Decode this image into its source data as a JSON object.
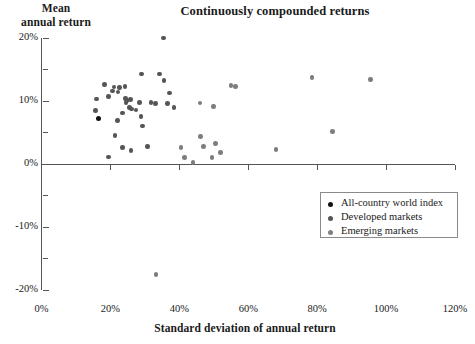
{
  "chart_data": {
    "type": "scatter",
    "title": "Continuously compounded returns",
    "xlabel": "Standard deviation of annual return",
    "ylabel": "Mean annual return",
    "xlim": [
      0,
      120
    ],
    "ylim": [
      -20,
      20
    ],
    "xticks": [
      "0%",
      "20%",
      "40%",
      "60%",
      "80%",
      "100%",
      "120%"
    ],
    "xtick_values": [
      0,
      20,
      40,
      60,
      80,
      100,
      120
    ],
    "yticks": [
      "20%",
      "10%",
      "0%",
      "-10%",
      "-20%"
    ],
    "ytick_values": [
      20,
      10,
      0,
      -10,
      -20
    ],
    "ytick_minor_values": [
      15,
      5,
      -5,
      -15
    ],
    "grid": false,
    "legend_position": "bottom-right",
    "legend": [
      {
        "label": "All-country world index",
        "color": "#111111"
      },
      {
        "label": "Developed markets",
        "color": "#555555"
      },
      {
        "label": "Emerging markets",
        "color": "#808080"
      }
    ],
    "series": [
      {
        "name": "All-country world index",
        "color": "#111111",
        "marker_size": 5,
        "points": [
          {
            "x": 16.5,
            "y": 7.3
          }
        ]
      },
      {
        "name": "Developed markets",
        "color": "#555555",
        "marker_size": 4.6,
        "points": [
          {
            "x": 15.6,
            "y": 8.5
          },
          {
            "x": 15.9,
            "y": 10.3
          },
          {
            "x": 18.3,
            "y": 12.6
          },
          {
            "x": 19.4,
            "y": 10.7
          },
          {
            "x": 20.6,
            "y": 11.6
          },
          {
            "x": 21.0,
            "y": 12.2
          },
          {
            "x": 22.2,
            "y": 11.4
          },
          {
            "x": 22.6,
            "y": 12.1
          },
          {
            "x": 24.2,
            "y": 12.3
          },
          {
            "x": 24.3,
            "y": 10.4
          },
          {
            "x": 24.5,
            "y": 9.8
          },
          {
            "x": 24.8,
            "y": 10.1
          },
          {
            "x": 23.5,
            "y": 8.1
          },
          {
            "x": 22.0,
            "y": 6.9
          },
          {
            "x": 25.6,
            "y": 9.0
          },
          {
            "x": 25.9,
            "y": 10.2
          },
          {
            "x": 26.2,
            "y": 8.7
          },
          {
            "x": 27.4,
            "y": 8.6
          },
          {
            "x": 28.4,
            "y": 9.8
          },
          {
            "x": 29.0,
            "y": 14.3
          },
          {
            "x": 31.8,
            "y": 9.8
          },
          {
            "x": 33.0,
            "y": 9.6
          },
          {
            "x": 34.2,
            "y": 14.3
          },
          {
            "x": 35.4,
            "y": 20.0
          },
          {
            "x": 35.6,
            "y": 13.3
          },
          {
            "x": 36.5,
            "y": 9.6
          },
          {
            "x": 37.2,
            "y": 11.3
          },
          {
            "x": 38.4,
            "y": 9.0
          },
          {
            "x": 21.3,
            "y": 4.5
          },
          {
            "x": 23.5,
            "y": 2.6
          },
          {
            "x": 26.0,
            "y": 2.1
          },
          {
            "x": 28.9,
            "y": 7.5
          },
          {
            "x": 29.3,
            "y": 6.0
          },
          {
            "x": 30.8,
            "y": 2.8
          },
          {
            "x": 19.4,
            "y": 1.1
          }
        ]
      },
      {
        "name": "Emerging markets",
        "color": "#7d7d7d",
        "marker_size": 4.6,
        "points": [
          {
            "x": 40.5,
            "y": 2.6
          },
          {
            "x": 41.5,
            "y": 1.0
          },
          {
            "x": 44.0,
            "y": 0.2
          },
          {
            "x": 46.2,
            "y": 4.4
          },
          {
            "x": 47.0,
            "y": 2.8
          },
          {
            "x": 49.5,
            "y": 1.0
          },
          {
            "x": 50.5,
            "y": 3.3
          },
          {
            "x": 52.0,
            "y": 1.8
          },
          {
            "x": 55.0,
            "y": 12.5
          },
          {
            "x": 56.3,
            "y": 12.3
          },
          {
            "x": 68.0,
            "y": 2.3
          },
          {
            "x": 78.5,
            "y": 13.7
          },
          {
            "x": 84.5,
            "y": 5.2
          },
          {
            "x": 95.5,
            "y": 13.4
          },
          {
            "x": 33.2,
            "y": -17.5
          },
          {
            "x": 46.0,
            "y": 9.7
          },
          {
            "x": 50.0,
            "y": 9.1
          }
        ]
      }
    ]
  }
}
